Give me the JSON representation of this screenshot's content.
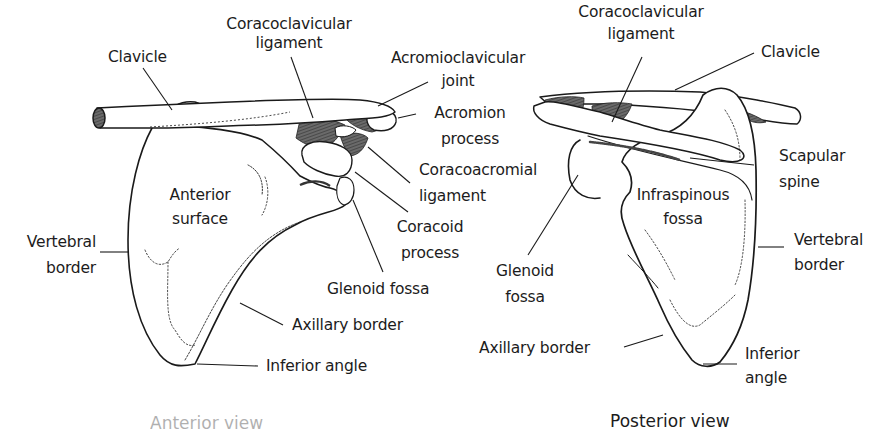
{
  "figure": {
    "colors": {
      "line": "#1a1a1a",
      "ligament": "#555555",
      "background": "#ffffff"
    },
    "anterior_view": {
      "caption": "Anterior view",
      "labels": {
        "clavicle": "Clavicle",
        "coracoclavicular_1": "Coracoclavicular",
        "coracoclavicular_2": "ligament",
        "acromioclavicular_1": "Acromioclavicular",
        "acromioclavicular_2": "joint",
        "acromion_1": "Acromion",
        "acromion_2": "process",
        "coracoacromial_1": "Coracoacromial",
        "coracoacromial_2": "ligament",
        "coracoid_1": "Coracoid",
        "coracoid_2": "process",
        "glenoid": "Glenoid fossa",
        "anterior_1": "Anterior",
        "anterior_2": "surface",
        "vertebral_1": "Vertebral",
        "vertebral_2": "border",
        "axillary": "Axillary border",
        "inferior": "Inferior angle"
      }
    },
    "posterior_view": {
      "caption": "Posterior view",
      "labels": {
        "coracoclavicular_1": "Coracoclavicular",
        "coracoclavicular_2": "ligament",
        "clavicle": "Clavicle",
        "scapular_spine_1": "Scapular",
        "scapular_spine_2": "spine",
        "infraspinous_1": "Infraspinous",
        "infraspinous_2": "fossa",
        "vertebral_1": "Vertebral",
        "vertebral_2": "border",
        "glenoid_1": "Glenoid",
        "glenoid_2": "fossa",
        "axillary": "Axillary border",
        "inferior_1": "Inferior",
        "inferior_2": "angle"
      }
    }
  }
}
